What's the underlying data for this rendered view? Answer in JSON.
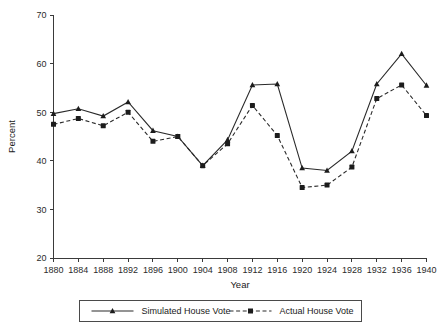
{
  "chart_data": {
    "type": "line",
    "title": "",
    "subtitle": "",
    "xlabel": "Year",
    "ylabel": "Percent",
    "x": [
      1880,
      1884,
      1888,
      1892,
      1896,
      1900,
      1904,
      1908,
      1912,
      1916,
      1920,
      1924,
      1928,
      1932,
      1936,
      1940
    ],
    "xticklabels": [
      "1880",
      "1884",
      "1888",
      "1892",
      "1896",
      "1900",
      "1904",
      "1908",
      "1912",
      "1916",
      "1920",
      "1924",
      "1928",
      "1932",
      "1936",
      "1940"
    ],
    "yticks": [
      20,
      30,
      40,
      50,
      60,
      70
    ],
    "yticklabels": [
      "20",
      "30",
      "40",
      "50",
      "60",
      "70"
    ],
    "xlim": [
      1880,
      1940
    ],
    "ylim": [
      20,
      70
    ],
    "grid": false,
    "legend_position": "below-axes",
    "series": [
      {
        "name": "Simulated House Vote",
        "marker": "triangle",
        "linestyle": "solid",
        "color": "#1c1c1c",
        "values": [
          49.7,
          50.7,
          49.2,
          52.1,
          46.2,
          45.0,
          39.0,
          44.3,
          55.6,
          55.8,
          38.5,
          38.0,
          42.0,
          55.8,
          62.0,
          55.5
        ]
      },
      {
        "name": "Actual House Vote",
        "marker": "square",
        "linestyle": "dashed",
        "color": "#1c1c1c",
        "values": [
          47.5,
          48.7,
          47.2,
          50.0,
          44.0,
          45.0,
          39.0,
          43.5,
          51.4,
          45.2,
          34.5,
          35.0,
          38.7,
          52.8,
          55.6,
          49.3
        ]
      }
    ]
  },
  "legend": {
    "entries": [
      {
        "label": "Simulated House Vote"
      },
      {
        "label": "Actual House Vote"
      }
    ]
  },
  "axes": {
    "x_title": "Year",
    "y_title": "Percent"
  }
}
